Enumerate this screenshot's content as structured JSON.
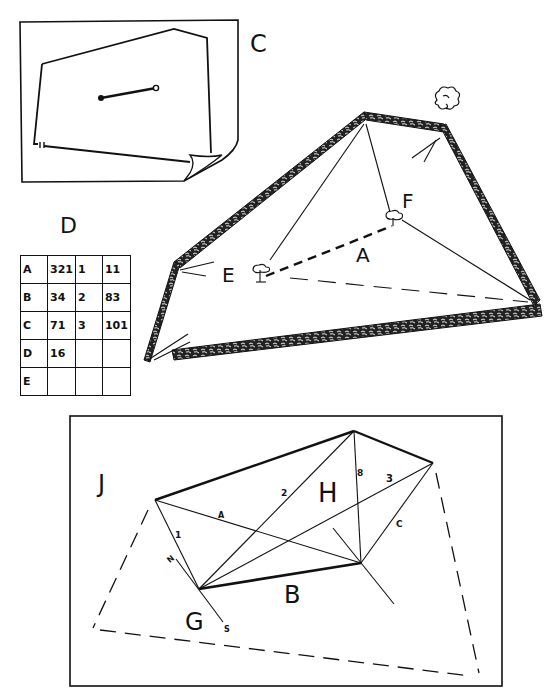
{
  "panel_c": {
    "label": "C"
  },
  "panel_d": {
    "label": "D",
    "rows": [
      {
        "key": "A",
        "values": [
          "321",
          "1",
          "11"
        ]
      },
      {
        "key": "B",
        "values": [
          "34",
          "2",
          "83"
        ]
      },
      {
        "key": "C",
        "values": [
          "71",
          "3",
          "101"
        ]
      },
      {
        "key": "D",
        "values": [
          "16",
          "",
          ""
        ]
      },
      {
        "key": "E",
        "values": [
          "",
          "",
          ""
        ]
      }
    ]
  },
  "field_sketch": {
    "labels": {
      "e": "E",
      "f": "F",
      "a": "A"
    }
  },
  "survey_plan": {
    "labels": {
      "j": "J",
      "h": "H",
      "g": "G",
      "b": "B",
      "line_a": "A",
      "line_c": "C",
      "line_1": "1",
      "line_2": "2",
      "line_3": "3",
      "line_8": "8",
      "north": "N",
      "south": "S"
    }
  }
}
